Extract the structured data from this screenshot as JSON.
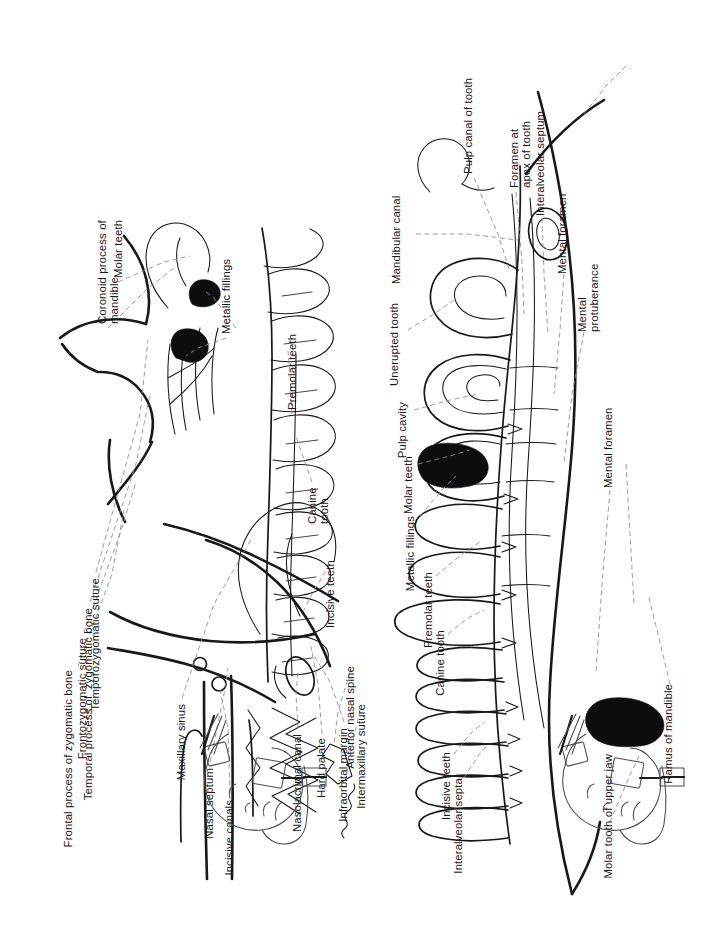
{
  "figure": {
    "orientation": "page rotated 90 degrees counter-clockwise",
    "background_color": "#fefefe",
    "ink_color": "#17181a",
    "leader_color": "#8b8d90",
    "filling_color": "#0d0d0f"
  },
  "panels": [
    {
      "id": "upper-jaw",
      "name": "Upper jaw (maxilla) radiograph tracing",
      "labels": [
        "Frontal process of zygomatic bone",
        "Frontozygomatic suture",
        "Temporal process of  zygomatic bone",
        "Temporozygomatic suture",
        "Maxillary sinus",
        "Nasal septum",
        "Incisive canals",
        "Nasolacrimal canal",
        "Hard palate",
        "Infraorbital margin",
        "Coronoid process of\nmandible",
        "Molar teeth",
        "Metallic fillings",
        "Premolar teeth",
        "Canine\ntooth",
        "Incisive teeth",
        "Anterior nasal spine",
        "Intermaxillary suture"
      ]
    },
    {
      "id": "lower-jaw",
      "name": "Lower jaw (mandible) radiograph tracing",
      "labels": [
        "Unerupted tooth",
        "Mandibular canal",
        "Pulp cavity",
        "Molar teeth",
        "Metallic fillings",
        "Premolar teeth",
        "Canine tooth",
        "Incisive teeth",
        "Interalveolar septa",
        "Pulp canal of tooth",
        "Foramen at\napex of tooth",
        "Interalveolar septum",
        "Mental foramen",
        "Mental\nprotuberance",
        "Mental foramen",
        "Molar tooth of upper jaw",
        "Ramus of mandible"
      ]
    }
  ],
  "labels": {
    "frontal_process_zygomatic_bone": "Frontal process of zygomatic bone",
    "frontozygomatic_suture": "Frontozygomatic suture",
    "temporal_process_zygomatic_bone": "Temporal process of  zygomatic bone",
    "temporozygomatic_suture": "Temporozygomatic suture",
    "maxillary_sinus": "Maxillary sinus",
    "nasal_septum": "Nasal septum",
    "incisive_canals": "Incisive canals",
    "nasolacrimal_canal": "Nasolacrimal canal",
    "hard_palate": "Hard palate",
    "infraorbital_margin": "Infraorbital margin",
    "coronoid_process_line1": "Coronoid process of",
    "coronoid_process_line2": "mandible",
    "molar_teeth_upper": "Molar teeth",
    "metallic_fillings_upper": "Metallic fillings",
    "premolar_teeth_upper": "Premolar teeth",
    "canine_tooth_upper_line1": "Canine",
    "canine_tooth_upper_line2": "tooth",
    "incisive_teeth_upper": "Incisive teeth",
    "anterior_nasal_spine": "Anterior nasal spine",
    "intermaxillary_suture": "Intermaxillary suture",
    "unerupted_tooth": "Unerupted tooth",
    "mandibular_canal": "Mandibular canal",
    "pulp_cavity": "Pulp cavity",
    "molar_teeth_lower": "Molar teeth",
    "metallic_fillings_lower": "Metallic fillings",
    "premolar_teeth_lower": "Premolar teeth",
    "canine_tooth_lower": "Canine tooth",
    "incisive_teeth_lower": "Incisive teeth",
    "interalveolar_septa": "Interalveolar septa",
    "pulp_canal_of_tooth": "Pulp canal of tooth",
    "foramen_apex_line1": "Foramen at",
    "foramen_apex_line2": "apex of tooth",
    "interalveolar_septum": "Interalveolar septum",
    "mental_foramen_top": "Mental foramen",
    "mental_protuberance_line1": "Mental",
    "mental_protuberance_line2": "protuberance",
    "mental_foramen_bottom": "Mental foramen",
    "molar_tooth_of_upper_jaw": "Molar tooth of upper jaw",
    "ramus_of_mandible": "Ramus of mandible"
  },
  "thumbnails": [
    {
      "id": "positioning-upper",
      "name": "Head positioning diagram for upper jaw radiograph",
      "description": "Lateral view of head with intraoral film and X-ray tube"
    },
    {
      "id": "positioning-lower",
      "name": "Head positioning diagram for lower jaw radiograph",
      "description": "Lateral view of head with intraoral film and X-ray tube"
    }
  ]
}
